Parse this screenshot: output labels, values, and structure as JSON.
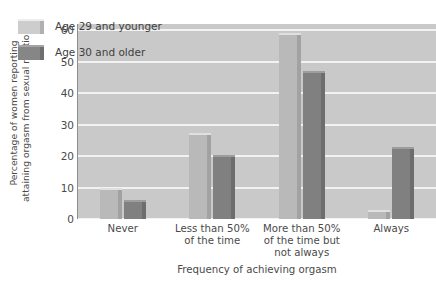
{
  "chart_data": {
    "type": "bar",
    "title": "",
    "xlabel": "Frequency of achieving orgasm",
    "ylabel": "Percentage of women reporting attaining orgasm from sexual relations",
    "ylabel_line1": "Percentage of women reporting",
    "ylabel_line2": "attaining orgasm from sexual relations",
    "categories": [
      "Never",
      "Less than 50% of the time",
      "More than 50% of the time but not always",
      "Always"
    ],
    "category_lines": [
      [
        "Never"
      ],
      [
        "Less than 50%",
        "of the time"
      ],
      [
        "More than 50%",
        "of the time but",
        "not always"
      ],
      [
        "Always"
      ]
    ],
    "series": [
      {
        "name": "Age 29 and younger",
        "color": "#b9b9b9",
        "values": [
          10,
          27.5,
          59,
          3
        ]
      },
      {
        "name": "Age 30 and older",
        "color": "#808080",
        "values": [
          6,
          20.5,
          47,
          23
        ]
      }
    ],
    "yticks": [
      0,
      10,
      20,
      30,
      40,
      50,
      60
    ],
    "ylim": [
      0,
      62
    ],
    "grid": true,
    "legend_position": "top-left",
    "plot_background": "#c9c9c9",
    "gridline_color": "#f2f2f2"
  }
}
